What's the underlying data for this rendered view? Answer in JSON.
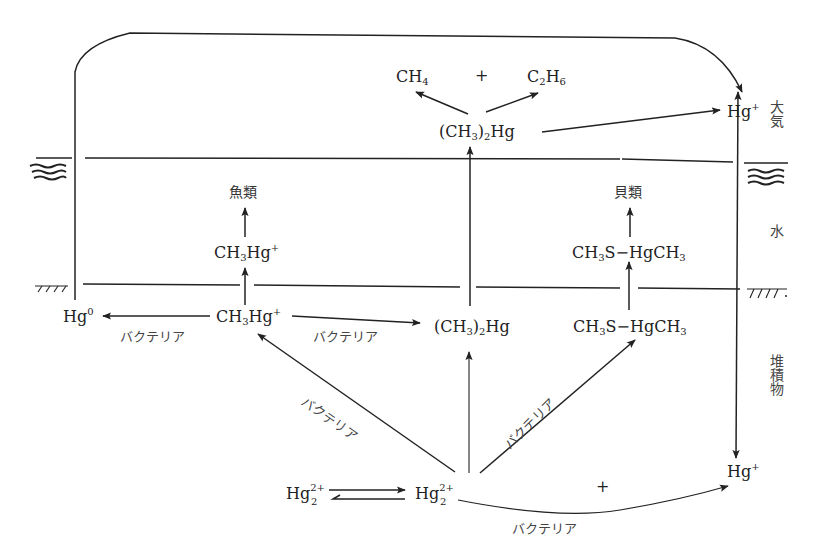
{
  "diagram": {
    "type": "mercury-cycle",
    "zones": {
      "atmosphere": "大気",
      "water": "水",
      "sediment": "堆積物"
    },
    "nodes": {
      "ch4": {
        "main": "CH",
        "sub": "4"
      },
      "plus_top": "+",
      "c2h6": {
        "c": "C",
        "sub1": "2",
        "h": "H",
        "sub2": "6"
      },
      "dimethylmercury_air": {
        "open": "(CH",
        "sub1": "3",
        "close": ")",
        "sub2": "2",
        "tail": "Hg"
      },
      "hg_plus_air": {
        "main": "Hg",
        "sup": "+"
      },
      "fish": "魚類",
      "shellfish": "貝類",
      "methylmercury_water": {
        "pre": "CH",
        "sub": "3",
        "post": "Hg",
        "sup": "+"
      },
      "methylthio_water": {
        "pre": "CH",
        "sub1": "3",
        "mid": "S−HgCH",
        "sub2": "3"
      },
      "hg0": {
        "main": "Hg",
        "sup": "0"
      },
      "methylmercury_sed": {
        "pre": "CH",
        "sub": "3",
        "post": "Hg",
        "sup": "+"
      },
      "dimethylmercury_sed": {
        "open": "(CH",
        "sub1": "3",
        "close": ")",
        "sub2": "2",
        "tail": "Hg"
      },
      "methylthio_sed": {
        "pre": "CH",
        "sub1": "3",
        "mid": "S−HgCH",
        "sub2": "3"
      },
      "hg2_2plus_left": {
        "main": "Hg",
        "sup": "2+",
        "sub": "2"
      },
      "hg2_2plus_center": {
        "main": "Hg",
        "sup": "2+",
        "sub": "2"
      },
      "plus_bottom": "+",
      "hg_plus_sed": {
        "main": "Hg",
        "sup": "+"
      }
    },
    "edge_labels": {
      "bacteria_to_hg0": "バクテリア",
      "bacteria_to_dimethyl": "バクテリア",
      "bacteria_diag_left": "バクテリア",
      "bacteria_diag_right": "バクテリア",
      "bacteria_bottom": "バクテリア"
    },
    "colors": {
      "ink": "#222222",
      "background": "#ffffff"
    }
  }
}
